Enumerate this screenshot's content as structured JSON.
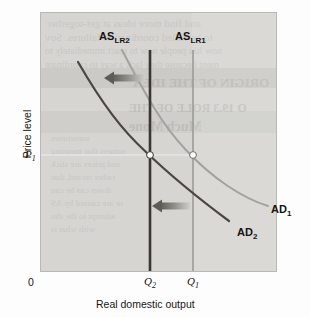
{
  "figure": {
    "background_color": "#fdfdfd",
    "panel_color": "#d6d5d2",
    "panel_border_color": "#b9b8b4"
  },
  "axes": {
    "y_title": "Price level",
    "x_title": "Real domestic output",
    "origin_label": "0",
    "y_ticks": [
      {
        "id": "P1",
        "base": "P",
        "sub": "1",
        "value_y_px": 155
      }
    ],
    "x_ticks": [
      {
        "id": "Q2",
        "base": "Q",
        "sub": "2",
        "value_x_px": 150
      },
      {
        "id": "Q1",
        "base": "Q",
        "sub": "1",
        "value_x_px": 193
      }
    ]
  },
  "colors": {
    "as_lr2_line": "#3b3833",
    "as_lr1_line": "#9b9a96",
    "ad2_curve": "#4a4742",
    "ad1_curve": "#a3a29e",
    "arrow_dark": "#6d6b66",
    "arrow_light": "#c3c2be",
    "equilibrium_dot_fill": "#ffffff",
    "guide_line": "#efeeeb"
  },
  "curve_labels": [
    {
      "name": "as-lr2-label",
      "base": "AS",
      "sub": "LR2",
      "x": 99,
      "y": 36
    },
    {
      "name": "as-lr1-label",
      "base": "AS",
      "sub": "LR1",
      "x": 175,
      "y": 36
    },
    {
      "name": "ad1-label",
      "base": "AD",
      "sub": "1",
      "x": 271,
      "y": 210
    },
    {
      "name": "ad2-label",
      "base": "AD",
      "sub": "2",
      "x": 237,
      "y": 233
    }
  ],
  "bleed_text": {
    "note": "faint mirrored show-through text from reverse side of printed page",
    "lines": [
      {
        "text": "and find more ideas at get-together",
        "x": 6,
        "y": 4,
        "size": 11,
        "weight": "normal"
      },
      {
        "text": "to be called coordination failures. Sov",
        "x": 4,
        "y": 18,
        "size": 11,
        "weight": "normal"
      },
      {
        "text": "now has people now to react immediately to",
        "x": 4,
        "y": 32,
        "size": 10,
        "weight": "normal"
      },
      {
        "text": "ment because they lack a way to coordinate",
        "x": 4,
        "y": 46,
        "size": 10,
        "weight": "normal"
      },
      {
        "text": "ORIGIN OF THE IDEA",
        "x": 92,
        "y": 62,
        "size": 13,
        "weight": "bold"
      },
      {
        "text": "O 19.3 ROLE OF THE",
        "x": 88,
        "y": 88,
        "size": 12,
        "weight": "bold"
      },
      {
        "text": "Much Mone",
        "x": 88,
        "y": 106,
        "size": 14,
        "weight": "bold"
      },
      {
        "text": "sometimes",
        "x": 10,
        "y": 120,
        "size": 9,
        "weight": "normal"
      },
      {
        "text": "sumers that meaning",
        "x": 10,
        "y": 133,
        "size": 9,
        "weight": "normal"
      },
      {
        "text": "and prices are stick",
        "x": 10,
        "y": 146,
        "size": 9,
        "weight": "normal"
      },
      {
        "text": "rather record, that",
        "x": 10,
        "y": 159,
        "size": 9,
        "weight": "normal"
      },
      {
        "text": "down can be cau",
        "x": 10,
        "y": 172,
        "size": 9,
        "weight": "normal"
      },
      {
        "text": "or are caused by AS",
        "x": 10,
        "y": 185,
        "size": 9,
        "weight": "normal"
      },
      {
        "text": "attempt to the sho",
        "x": 10,
        "y": 198,
        "size": 9,
        "weight": "normal"
      },
      {
        "text": "with what is",
        "x": 10,
        "y": 211,
        "size": 9,
        "weight": "normal"
      }
    ],
    "bands": [
      {
        "y": 55,
        "h": 20,
        "color": "#cbcac6"
      },
      {
        "y": 98,
        "h": 22,
        "color": "#cfcecb"
      }
    ]
  },
  "chart_data": {
    "type": "line",
    "title": "",
    "subtitle": "",
    "xlabel": "Real domestic output",
    "ylabel": "Price level",
    "grid": false,
    "legend_position": "inline-curve-labels",
    "axis_ranges": {
      "x_px": [
        40,
        277
      ],
      "y_px": [
        12,
        272
      ]
    },
    "annotation_note": "Leftward shift of both long-run aggregate supply (AS_LR1 to AS_LR2) and aggregate demand (AD1 to AD2), leaving the price level unchanged at P1 while real output falls from Q1 to Q2.",
    "series": [
      {
        "name": "AS_LR1",
        "kind": "vertical-line",
        "color": "#9b9a96",
        "width": 1.6,
        "x_px": 193,
        "y_from_px": 50,
        "y_to_px": 272
      },
      {
        "name": "AS_LR2",
        "kind": "vertical-line",
        "color": "#3b3833",
        "width": 2.6,
        "x_px": 150,
        "y_from_px": 50,
        "y_to_px": 272
      },
      {
        "name": "AD_1",
        "kind": "curve",
        "color": "#a3a29e",
        "width": 2.0,
        "path": "M 122,50 C 146,96 163,126 186,150 C 212,178 242,198 268,206"
      },
      {
        "name": "AD_2",
        "kind": "curve",
        "color": "#4a4742",
        "width": 2.2,
        "path": "M 78,62 C 103,105 122,130 146,152 C 172,177 202,201 229,221"
      }
    ],
    "equilibria": [
      {
        "name": "equilibrium-1",
        "label": "AD1 x AS_LR1",
        "x_px": 193,
        "y_px": 155,
        "r": 3.4
      },
      {
        "name": "equilibrium-2",
        "label": "AD2 x AS_LR2",
        "x_px": 150,
        "y_px": 155,
        "r": 3.4
      }
    ],
    "guides": [
      {
        "name": "p1-guide",
        "kind": "horizontal",
        "y_px": 155,
        "x_from_px": 41,
        "x_to_px": 196,
        "color": "#efeeeb"
      }
    ],
    "arrows": [
      {
        "name": "as-shift-arrow",
        "direction": "left",
        "x_tail_px": 145,
        "x_head_px": 104,
        "y_px": 78,
        "meaning": "AS_LR shifts left"
      },
      {
        "name": "ad-shift-arrow",
        "direction": "left",
        "x_tail_px": 190,
        "x_head_px": 152,
        "y_px": 206,
        "meaning": "AD shifts left"
      }
    ]
  }
}
